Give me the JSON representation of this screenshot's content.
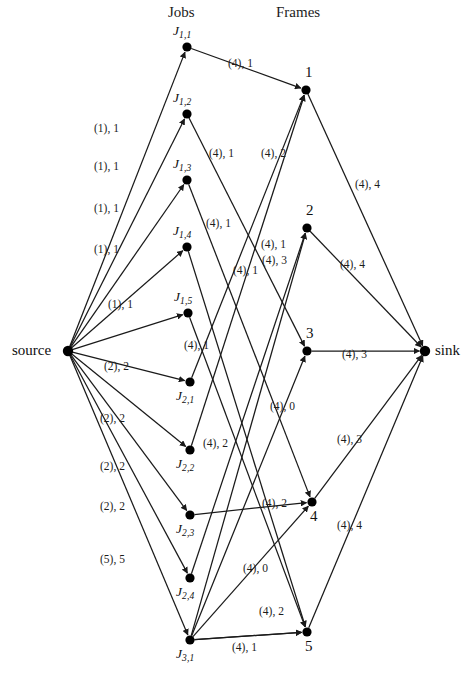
{
  "figure": {
    "columns": {
      "jobs_header": "Jobs",
      "frames_header": "Frames"
    },
    "edge_label_format": "(capacity), flow",
    "colors": {
      "node": "#000000",
      "edge": "#1a1a1a",
      "text": "#1c1c1c",
      "background": "#ffffff"
    }
  },
  "nodes": {
    "source": {
      "id": "source",
      "label": "source",
      "x": 68,
      "y": 351,
      "label_dx": -56,
      "label_dy": -9
    },
    "sink": {
      "id": "sink",
      "label": "sink",
      "x": 425,
      "y": 351,
      "label_dx": 10,
      "label_dy": -9
    },
    "jobs": [
      {
        "id": "J11",
        "label": "J",
        "sub": "1,1",
        "x": 187,
        "y": 47,
        "label_dx": -14,
        "label_dy": -24
      },
      {
        "id": "J12",
        "label": "J",
        "sub": "1,2",
        "x": 187,
        "y": 114,
        "label_dx": -14,
        "label_dy": -24
      },
      {
        "id": "J13",
        "label": "J",
        "sub": "1,3",
        "x": 187,
        "y": 180,
        "label_dx": -14,
        "label_dy": -24
      },
      {
        "id": "J14",
        "label": "J",
        "sub": "1,4",
        "x": 187,
        "y": 247,
        "label_dx": -14,
        "label_dy": -24
      },
      {
        "id": "J15",
        "label": "J",
        "sub": "1,5",
        "x": 188,
        "y": 313,
        "label_dx": -14,
        "label_dy": -24
      },
      {
        "id": "J21",
        "label": "J",
        "sub": "2,1",
        "x": 190,
        "y": 382,
        "label_dx": -14,
        "label_dy": 6
      },
      {
        "id": "J22",
        "label": "J",
        "sub": "2,2",
        "x": 190,
        "y": 450,
        "label_dx": -14,
        "label_dy": 6
      },
      {
        "id": "J23",
        "label": "J",
        "sub": "2,3",
        "x": 190,
        "y": 515,
        "label_dx": -14,
        "label_dy": 6
      },
      {
        "id": "J24",
        "label": "J",
        "sub": "2,4",
        "x": 190,
        "y": 578,
        "label_dx": -14,
        "label_dy": 6
      },
      {
        "id": "J31",
        "label": "J",
        "sub": "3,1",
        "x": 190,
        "y": 640,
        "label_dx": -14,
        "label_dy": 6
      }
    ],
    "frames": [
      {
        "id": "F1",
        "label": "1",
        "x": 306,
        "y": 90,
        "label_dx": -1,
        "label_dy": -26
      },
      {
        "id": "F2",
        "label": "2",
        "x": 307,
        "y": 228,
        "label_dx": -1,
        "label_dy": -26
      },
      {
        "id": "F3",
        "label": "3",
        "x": 307,
        "y": 351,
        "label_dx": -1,
        "label_dy": -26
      },
      {
        "id": "F4",
        "label": "4",
        "x": 312,
        "y": 502,
        "label_dx": -2,
        "label_dy": 6
      },
      {
        "id": "F5",
        "label": "5",
        "x": 307,
        "y": 632,
        "label_dx": -2,
        "label_dy": 6
      }
    ]
  },
  "edges": [
    {
      "from": "source",
      "to": "J11",
      "capacity": 1,
      "flow": 1,
      "label": "(1), 1",
      "lx": 94,
      "ly": 122
    },
    {
      "from": "source",
      "to": "J12",
      "capacity": 1,
      "flow": 1,
      "label": "(1), 1",
      "lx": 94,
      "ly": 160
    },
    {
      "from": "source",
      "to": "J13",
      "capacity": 1,
      "flow": 1,
      "label": "(1), 1",
      "lx": 94,
      "ly": 202
    },
    {
      "from": "source",
      "to": "J14",
      "capacity": 1,
      "flow": 1,
      "label": "(1), 1",
      "lx": 94,
      "ly": 243
    },
    {
      "from": "source",
      "to": "J15",
      "capacity": 1,
      "flow": 1,
      "label": "(1), 1",
      "lx": 108,
      "ly": 298
    },
    {
      "from": "source",
      "to": "J21",
      "capacity": 2,
      "flow": 2,
      "label": "(2), 2",
      "lx": 104,
      "ly": 360
    },
    {
      "from": "source",
      "to": "J22",
      "capacity": 2,
      "flow": 2,
      "label": "(2), 2",
      "lx": 100,
      "ly": 412
    },
    {
      "from": "source",
      "to": "J23",
      "capacity": 2,
      "flow": 2,
      "label": "(2), 2",
      "lx": 100,
      "ly": 460
    },
    {
      "from": "source",
      "to": "J24",
      "capacity": 2,
      "flow": 2,
      "label": "(2), 2",
      "lx": 100,
      "ly": 500
    },
    {
      "from": "source",
      "to": "J31",
      "capacity": 5,
      "flow": 5,
      "label": "(5), 5",
      "lx": 100,
      "ly": 553
    },
    {
      "from": "J11",
      "to": "F1",
      "capacity": 4,
      "flow": 1,
      "label": "(4), 1",
      "lx": 228,
      "ly": 57
    },
    {
      "from": "J12",
      "to": "F3",
      "capacity": 4,
      "flow": 1,
      "label": "(4), 1",
      "lx": 209,
      "ly": 147
    },
    {
      "from": "J13",
      "to": "F4",
      "capacity": 4,
      "flow": 1,
      "label": "(4), 1",
      "lx": 206,
      "ly": 217
    },
    {
      "from": "J14",
      "to": "F5",
      "capacity": 4,
      "flow": 1,
      "label": "(4), 1",
      "lx": 233,
      "ly": 264
    },
    {
      "from": "J15",
      "to": "F5",
      "capacity": 4,
      "flow": 1,
      "label": "(4), 1",
      "lx": 184,
      "ly": 339
    },
    {
      "from": "J21",
      "to": "F1",
      "capacity": 4,
      "flow": 2,
      "label": "(4), 2",
      "lx": 261,
      "ly": 147
    },
    {
      "from": "J22",
      "to": "F1",
      "capacity": 4,
      "flow": 2,
      "label": "(4), 2",
      "lx": 203,
      "ly": 437
    },
    {
      "from": "J23",
      "to": "F4",
      "capacity": 4,
      "flow": 2,
      "label": "(4), 2",
      "lx": 262,
      "ly": 497
    },
    {
      "from": "J24",
      "to": "F2",
      "capacity": 4,
      "flow": 3,
      "label": "(4), 3",
      "lx": 262,
      "ly": 254
    },
    {
      "from": "J31",
      "to": "F2",
      "capacity": 4,
      "flow": 1,
      "label": "(4), 1",
      "lx": 261,
      "ly": 238
    },
    {
      "from": "J31",
      "to": "F3",
      "capacity": 4,
      "flow": 0,
      "label": "(4), 0",
      "lx": 270,
      "ly": 400
    },
    {
      "from": "J31",
      "to": "F4",
      "capacity": 4,
      "flow": 0,
      "label": "(4), 0",
      "lx": 243,
      "ly": 562
    },
    {
      "from": "J31",
      "to": "F5",
      "capacity": 4,
      "flow": 2,
      "label": "(4), 2",
      "lx": 259,
      "ly": 605
    },
    {
      "from": "J31",
      "to": "F5b",
      "capacity": 4,
      "flow": 1,
      "label": "(4), 1",
      "lx": 232,
      "ly": 641
    },
    {
      "from": "F1",
      "to": "sink",
      "capacity": 4,
      "flow": 4,
      "label": "(4), 4",
      "lx": 355,
      "ly": 178
    },
    {
      "from": "F2",
      "to": "sink",
      "capacity": 4,
      "flow": 4,
      "label": "(4), 4",
      "lx": 340,
      "ly": 258
    },
    {
      "from": "F3",
      "to": "sink",
      "capacity": 4,
      "flow": 3,
      "label": "(4), 3",
      "lx": 342,
      "ly": 348
    },
    {
      "from": "F4",
      "to": "sink",
      "capacity": 4,
      "flow": 3,
      "label": "(4), 3",
      "lx": 337,
      "ly": 433
    },
    {
      "from": "F5",
      "to": "sink",
      "capacity": 4,
      "flow": 4,
      "label": "(4), 4",
      "lx": 337,
      "ly": 519
    }
  ],
  "geometry": {
    "jobs_header_pos": {
      "x": 168,
      "y": 4
    },
    "frames_header_pos": {
      "x": 276,
      "y": 4
    }
  }
}
